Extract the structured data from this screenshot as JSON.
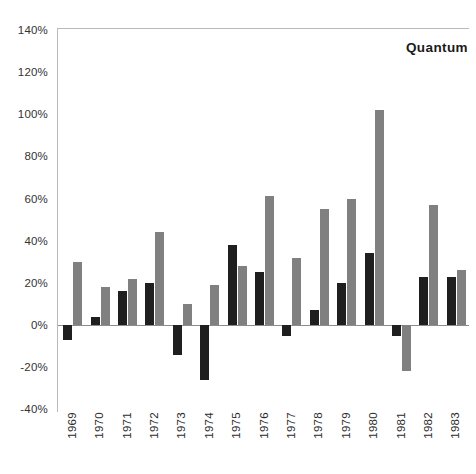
{
  "chart_data": {
    "type": "bar",
    "title": "Quantum",
    "xlabel": "",
    "ylabel": "",
    "ylim": [
      -40,
      140
    ],
    "ytick_step": 20,
    "grid": false,
    "legend_position": "none",
    "categories": [
      "1969",
      "1970",
      "1971",
      "1972",
      "1973",
      "1974",
      "1975",
      "1976",
      "1977",
      "1978",
      "1979",
      "1980",
      "1981",
      "1982",
      "1983"
    ],
    "ytick_labels": [
      "140%",
      "120%",
      "100%",
      "80%",
      "60%",
      "40%",
      "20%",
      "0%",
      "-20%",
      "-40%"
    ],
    "ytick_values": [
      140,
      120,
      100,
      80,
      60,
      40,
      20,
      0,
      -20,
      -40
    ],
    "series": [
      {
        "name": "dark",
        "color": "#201f20",
        "values": [
          -7,
          4,
          16,
          20,
          -14,
          -26,
          38,
          25,
          -5,
          7,
          20,
          34,
          -5,
          23,
          23
        ]
      },
      {
        "name": "light",
        "color": "#808080",
        "values": [
          30,
          18,
          22,
          44,
          10,
          19,
          28,
          61,
          32,
          55,
          60,
          102,
          -22,
          57,
          26
        ]
      }
    ]
  },
  "colors": {
    "dark_series": "#201f20",
    "light_series": "#808080",
    "axis": "#8c8c8c",
    "frame": "#b9b9b9",
    "text": "#2b2b2b",
    "background": "#ffffff"
  }
}
